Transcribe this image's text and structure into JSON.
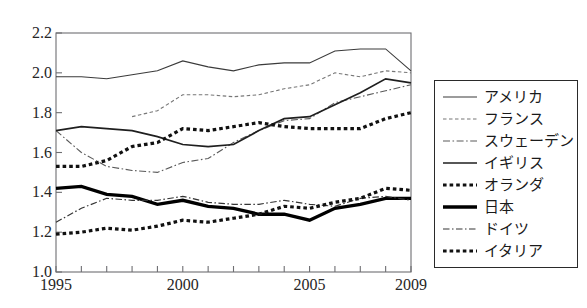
{
  "chart_data": {
    "type": "line",
    "title": "",
    "xlabel": "",
    "ylabel": "",
    "xlim": [
      1995,
      2009
    ],
    "ylim": [
      1.0,
      2.2
    ],
    "ytick_labels": [
      "2.2",
      "2.0",
      "1.8",
      "1.6",
      "1.4",
      "1.2",
      "1.0"
    ],
    "ytick_values": [
      2.2,
      2.0,
      1.8,
      1.6,
      1.4,
      1.2,
      1.0
    ],
    "xtick_labels": [
      "1995",
      "2000",
      "2005",
      "2009"
    ],
    "xtick_values": [
      1995,
      2000,
      2005,
      2009
    ],
    "x": [
      1995,
      1996,
      1997,
      1998,
      1999,
      2000,
      2001,
      2002,
      2003,
      2004,
      2005,
      2006,
      2007,
      2008,
      2009
    ],
    "grid": false,
    "legend_position": "right-outside",
    "series": [
      {
        "name": "アメリカ",
        "style": "solid-thin",
        "color": "#3b3b3b",
        "values": [
          1.98,
          1.98,
          1.97,
          1.99,
          2.01,
          2.06,
          2.03,
          2.01,
          2.04,
          2.05,
          2.05,
          2.11,
          2.12,
          2.12,
          2.01
        ]
      },
      {
        "name": "フランス",
        "style": "dotted-fine",
        "color": "#777777",
        "values": [
          null,
          null,
          null,
          1.78,
          1.81,
          1.89,
          1.89,
          1.88,
          1.89,
          1.92,
          1.94,
          2.0,
          1.98,
          2.01,
          2.0
        ]
      },
      {
        "name": "スウェーデン",
        "style": "dashdot-thin",
        "color": "#5a5a5a",
        "values": [
          1.71,
          1.6,
          1.53,
          1.51,
          1.5,
          1.55,
          1.57,
          1.65,
          1.71,
          1.76,
          1.77,
          1.85,
          1.88,
          1.91,
          1.94
        ]
      },
      {
        "name": "イギリス",
        "style": "solid-medium",
        "color": "#1f1f1f",
        "values": [
          1.71,
          1.73,
          1.72,
          1.71,
          1.68,
          1.64,
          1.63,
          1.64,
          1.71,
          1.77,
          1.78,
          1.84,
          1.9,
          1.97,
          1.95
        ]
      },
      {
        "name": "オランダ",
        "style": "dotted-bold",
        "color": "#111111",
        "values": [
          1.53,
          1.53,
          1.56,
          1.63,
          1.65,
          1.72,
          1.71,
          1.73,
          1.75,
          1.73,
          1.72,
          1.72,
          1.72,
          1.77,
          1.8
        ]
      },
      {
        "name": "日本",
        "style": "solid-thick",
        "color": "#000000",
        "values": [
          1.42,
          1.43,
          1.39,
          1.38,
          1.34,
          1.36,
          1.33,
          1.32,
          1.29,
          1.29,
          1.26,
          1.32,
          1.34,
          1.37,
          1.37
        ]
      },
      {
        "name": "ドイツ",
        "style": "dashdot-thin2",
        "color": "#343434",
        "values": [
          1.25,
          1.32,
          1.37,
          1.36,
          1.36,
          1.38,
          1.35,
          1.34,
          1.34,
          1.36,
          1.34,
          1.33,
          1.37,
          1.38,
          1.36
        ]
      },
      {
        "name": "イタリア",
        "style": "dotted-bold2",
        "color": "#111111",
        "values": [
          1.19,
          1.2,
          1.22,
          1.21,
          1.23,
          1.26,
          1.25,
          1.27,
          1.29,
          1.33,
          1.32,
          1.35,
          1.37,
          1.42,
          1.41
        ]
      }
    ]
  },
  "axes": {
    "y_labels": [
      {
        "text": "2.2"
      },
      {
        "text": "2.0"
      },
      {
        "text": "1.8"
      },
      {
        "text": "1.6"
      },
      {
        "text": "1.4"
      },
      {
        "text": "1.2"
      },
      {
        "text": "1.0"
      }
    ],
    "x_labels": [
      {
        "text": "1995"
      },
      {
        "text": "2000"
      },
      {
        "text": "2005"
      },
      {
        "text": "2009"
      }
    ]
  },
  "legend": {
    "items": [
      {
        "label": "アメリカ"
      },
      {
        "label": "フランス"
      },
      {
        "label": "スウェーデン"
      },
      {
        "label": "イギリス"
      },
      {
        "label": "オランダ"
      },
      {
        "label": "日本"
      },
      {
        "label": "ドイツ"
      },
      {
        "label": "イタリア"
      }
    ]
  }
}
